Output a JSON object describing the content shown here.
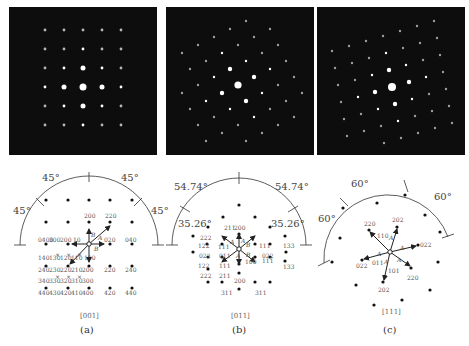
{
  "figure": {
    "panels": [
      {
        "id": "a",
        "caption": "(a)",
        "zone_axis": "[001]",
        "angles": [
          "45°",
          "45°",
          "45°",
          "45°"
        ],
        "spot_labels": [
          "200",
          "220",
          "0400",
          "300",
          "200",
          "10",
          "020",
          "040",
          "140",
          "130",
          "120",
          "110",
          "100",
          "240",
          "230",
          "220",
          "210",
          "200",
          "220",
          "240",
          "340",
          "330",
          "320",
          "310",
          "300",
          "440",
          "430",
          "420",
          "410",
          "400",
          "420",
          "440"
        ],
        "vector_labels": [
          "B",
          "A",
          "B"
        ]
      },
      {
        "id": "b",
        "caption": "(b)",
        "zone_axis": "[011]",
        "angles": [
          "54.74°",
          "54.74°",
          "35.26°",
          "35.26°"
        ],
        "spot_labels": [
          "200",
          "222",
          "211",
          "122",
          "111",
          "111",
          "133",
          "022",
          "011",
          "022",
          "122",
          "111",
          "100",
          "111",
          "133",
          "222",
          "211",
          "200",
          "311",
          "311"
        ],
        "vector_labels": [
          "A",
          "B",
          "B",
          "A",
          "A"
        ]
      },
      {
        "id": "c",
        "caption": "(c)",
        "zone_axis": "[111]",
        "angles": [
          "60°",
          "60°",
          "60°"
        ],
        "spot_labels": [
          "202",
          "220",
          "110",
          "022",
          "022",
          "011",
          "101",
          "220",
          "202"
        ],
        "vector_labels": [
          "A",
          "A",
          "A",
          "A",
          "A"
        ]
      }
    ]
  }
}
